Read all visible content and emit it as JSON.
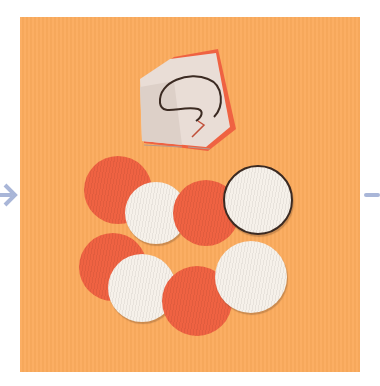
{
  "image": {
    "description": "Craft step photo: folded paper with a spiral cut-line above, and eight cut paper circles (alternating red-orange and white) on an orange background",
    "background_color": "#fbab5d",
    "colors": {
      "red_circle": "#ef6242",
      "white_circle": "#f6f1ea",
      "arrow": "#a9b6d8"
    },
    "circles": [
      {
        "color": "red",
        "cx": 118,
        "cy": 190,
        "r": 34
      },
      {
        "color": "white",
        "cx": 156,
        "cy": 213,
        "r": 31
      },
      {
        "color": "red",
        "cx": 206,
        "cy": 213,
        "r": 33
      },
      {
        "color": "white",
        "cx": 259,
        "cy": 201,
        "r": 34,
        "outlined": true
      },
      {
        "color": "red",
        "cx": 113,
        "cy": 267,
        "r": 34
      },
      {
        "color": "white",
        "cx": 142,
        "cy": 288,
        "r": 34
      },
      {
        "color": "red",
        "cx": 197,
        "cy": 301,
        "r": 35
      },
      {
        "color": "white",
        "cx": 251,
        "cy": 277,
        "r": 36
      }
    ],
    "left_arrow": "chevron-right-arrow",
    "right_arrow": "partial-arrow"
  }
}
